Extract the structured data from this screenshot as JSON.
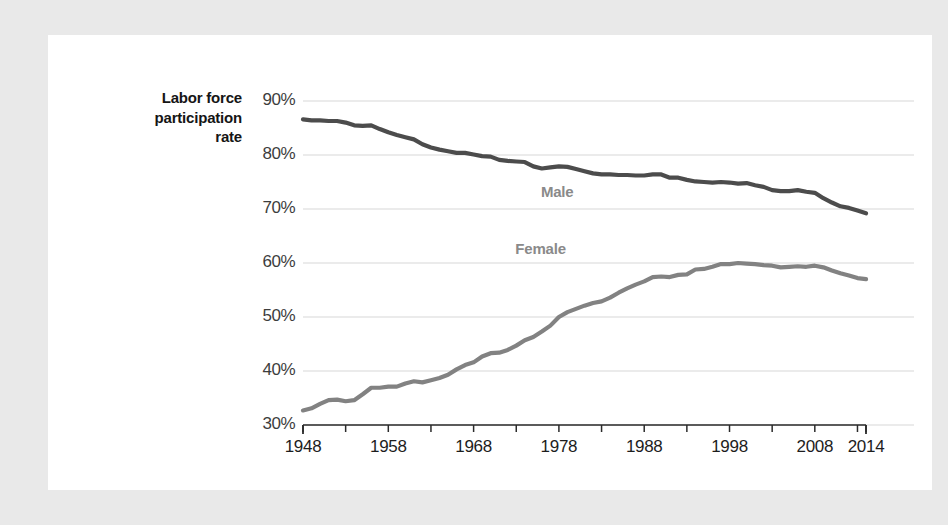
{
  "axis_title": {
    "line1": "Labor force",
    "line2": "participation",
    "line3": "rate"
  },
  "colors": {
    "page_background": "#e9e9e9",
    "card_background": "#ffffff",
    "male_line": "#4c4c4c",
    "female_line": "#828282",
    "gridline": "#e4e4e4",
    "axis_line": "#2b2b2b",
    "label_text": "#1d1d1d",
    "series_label_text": "#8a8a8a"
  },
  "chart_data": {
    "type": "line",
    "title": "Labor force participation rate",
    "xlabel": "",
    "ylabel": "Labor force participation rate",
    "grid": true,
    "legend_position": "inline-labels",
    "xlim": [
      1948,
      2014
    ],
    "ylim": [
      30,
      90
    ],
    "ytick_labels": [
      "90%",
      "80%",
      "70%",
      "60%",
      "50%",
      "40%",
      "30%"
    ],
    "ytick_values": [
      90,
      80,
      70,
      60,
      50,
      40,
      30
    ],
    "xtick_labels": [
      "1948",
      "1958",
      "1968",
      "1978",
      "1988",
      "1998",
      "2008",
      "2014"
    ],
    "xtick_values": [
      1948,
      1958,
      1968,
      1978,
      1988,
      1998,
      2008,
      2014
    ],
    "xtick_minor_values": [
      1953,
      1963,
      1973,
      1983,
      1993,
      2003,
      2013
    ],
    "x": [
      1948,
      1949,
      1950,
      1951,
      1952,
      1953,
      1954,
      1955,
      1956,
      1957,
      1958,
      1959,
      1960,
      1961,
      1962,
      1963,
      1964,
      1965,
      1966,
      1967,
      1968,
      1969,
      1970,
      1971,
      1972,
      1973,
      1974,
      1975,
      1976,
      1977,
      1978,
      1979,
      1980,
      1981,
      1982,
      1983,
      1984,
      1985,
      1986,
      1987,
      1988,
      1989,
      1990,
      1991,
      1992,
      1993,
      1994,
      1995,
      1996,
      1997,
      1998,
      1999,
      2000,
      2001,
      2002,
      2003,
      2004,
      2005,
      2006,
      2007,
      2008,
      2009,
      2010,
      2011,
      2012,
      2013,
      2014
    ],
    "series": [
      {
        "name": "Male",
        "color": "#4c4c4c",
        "label_x": 1978,
        "label_y": 73.2,
        "values": [
          86.6,
          86.4,
          86.4,
          86.3,
          86.3,
          86.0,
          85.5,
          85.4,
          85.5,
          84.8,
          84.2,
          83.7,
          83.3,
          82.9,
          82.0,
          81.4,
          81.0,
          80.7,
          80.4,
          80.4,
          80.1,
          79.8,
          79.7,
          79.1,
          78.9,
          78.8,
          78.7,
          77.9,
          77.5,
          77.7,
          77.9,
          77.8,
          77.4,
          77.0,
          76.6,
          76.4,
          76.4,
          76.3,
          76.3,
          76.2,
          76.2,
          76.4,
          76.4,
          75.8,
          75.8,
          75.4,
          75.1,
          75.0,
          74.9,
          75.0,
          74.9,
          74.7,
          74.8,
          74.4,
          74.1,
          73.5,
          73.3,
          73.3,
          73.5,
          73.2,
          73.0,
          72.0,
          71.2,
          70.5,
          70.2,
          69.7,
          69.2
        ]
      },
      {
        "name": "Female",
        "color": "#828282",
        "label_x": 1975,
        "label_y": 62.6,
        "values": [
          32.7,
          33.1,
          33.9,
          34.6,
          34.7,
          34.4,
          34.6,
          35.7,
          36.9,
          36.9,
          37.1,
          37.1,
          37.7,
          38.1,
          37.9,
          38.3,
          38.7,
          39.3,
          40.3,
          41.1,
          41.6,
          42.7,
          43.3,
          43.4,
          43.9,
          44.7,
          45.7,
          46.3,
          47.3,
          48.4,
          50.0,
          50.9,
          51.5,
          52.1,
          52.6,
          52.9,
          53.6,
          54.5,
          55.3,
          56.0,
          56.6,
          57.4,
          57.5,
          57.4,
          57.8,
          57.9,
          58.8,
          58.9,
          59.3,
          59.8,
          59.8,
          60.0,
          59.9,
          59.8,
          59.6,
          59.5,
          59.2,
          59.3,
          59.4,
          59.3,
          59.5,
          59.2,
          58.6,
          58.1,
          57.7,
          57.2,
          57.0
        ]
      }
    ]
  }
}
